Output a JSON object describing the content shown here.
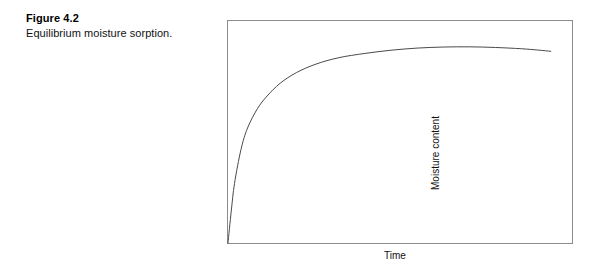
{
  "page": {
    "background_color": "#ffffff",
    "width": 602,
    "height": 276
  },
  "caption": {
    "figure_number": "Figure 4.2",
    "text": "Equilibrium moisture sorption."
  },
  "chart_data": {
    "type": "line",
    "title": "",
    "subtitle": "",
    "xlabel": "Time",
    "ylabel": "Moisture content",
    "grid": false,
    "legend": null,
    "axis_ticks": {
      "x": [],
      "y": []
    },
    "xlim": [
      0,
      1
    ],
    "ylim": [
      0,
      1
    ],
    "frame_color": "#8c8c8c",
    "line_color": "#4a4a4a",
    "line_width": 1,
    "annotations": [],
    "series": [
      {
        "name": "Equilibrium moisture sorption",
        "description": "Moisture content rises steeply from zero, curves over to a broad plateau, then declines very slightly toward the end of the record.",
        "x": [
          0.0,
          0.01,
          0.02,
          0.04,
          0.06,
          0.09,
          0.12,
          0.16,
          0.21,
          0.27,
          0.34,
          0.42,
          0.5,
          0.58,
          0.66,
          0.74,
          0.82,
          0.9,
          0.95,
          0.99
        ],
        "y": [
          0.0,
          0.15,
          0.28,
          0.44,
          0.54,
          0.63,
          0.69,
          0.75,
          0.8,
          0.84,
          0.87,
          0.89,
          0.905,
          0.915,
          0.92,
          0.921,
          0.918,
          0.912,
          0.906,
          0.9
        ]
      }
    ]
  }
}
